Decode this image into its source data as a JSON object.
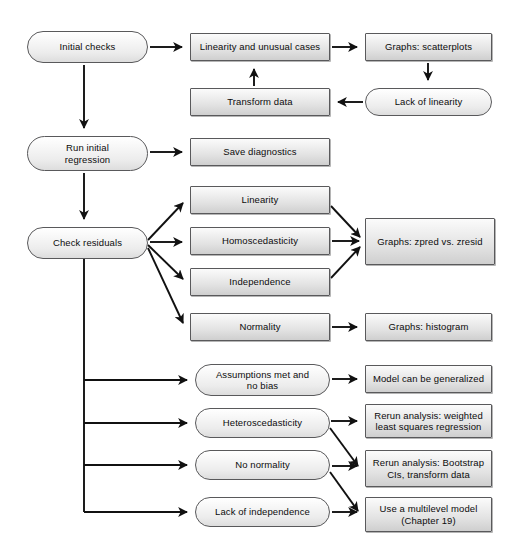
{
  "diagram": {
    "style": {
      "node_fill_top": "#fbfbfb",
      "node_fill_bottom": "#cfcfcf",
      "node_border": "#59595b",
      "edge_color": "#1a1a1a",
      "text_color": "#0c0c0c",
      "background": "#ffffff"
    },
    "nodes": [
      {
        "id": "initial_checks",
        "label": "Initial checks",
        "shape": "pill",
        "x": 27,
        "y": 31,
        "w": 121,
        "h": 32
      },
      {
        "id": "linearity_unusual",
        "label": "Linearity and unusual cases",
        "shape": "rect",
        "x": 190,
        "y": 33,
        "w": 140,
        "h": 28
      },
      {
        "id": "graphs_scatterplots",
        "label": "Graphs: scatterplots",
        "shape": "rect",
        "x": 365,
        "y": 33,
        "w": 127,
        "h": 28
      },
      {
        "id": "transform_data",
        "label": "Transform data",
        "shape": "rect",
        "x": 190,
        "y": 88,
        "w": 140,
        "h": 28
      },
      {
        "id": "lack_of_linearity",
        "label": "Lack of linearity",
        "shape": "pill",
        "x": 365,
        "y": 88,
        "w": 127,
        "h": 28
      },
      {
        "id": "run_initial_regression",
        "label": "Run initial\nregression",
        "shape": "pill",
        "x": 27,
        "y": 136,
        "w": 121,
        "h": 35
      },
      {
        "id": "save_diagnostics",
        "label": "Save diagnostics",
        "shape": "rect",
        "x": 190,
        "y": 138,
        "w": 140,
        "h": 28
      },
      {
        "id": "check_residuals",
        "label": "Check residuals",
        "shape": "pill",
        "x": 27,
        "y": 227,
        "w": 121,
        "h": 32
      },
      {
        "id": "linearity",
        "label": "Linearity",
        "shape": "rect",
        "x": 190,
        "y": 186,
        "w": 140,
        "h": 28
      },
      {
        "id": "homoscedasticity",
        "label": "Homoscedasticity",
        "shape": "rect",
        "x": 190,
        "y": 227,
        "w": 140,
        "h": 28
      },
      {
        "id": "independence",
        "label": "Independence",
        "shape": "rect",
        "x": 190,
        "y": 268,
        "w": 140,
        "h": 28
      },
      {
        "id": "graphs_zpred_zresid",
        "label": "Graphs: zpred vs. zresid",
        "shape": "rect",
        "x": 365,
        "y": 218,
        "w": 130,
        "h": 47
      },
      {
        "id": "normality",
        "label": "Normality",
        "shape": "rect",
        "x": 190,
        "y": 313,
        "w": 140,
        "h": 28
      },
      {
        "id": "graphs_histogram",
        "label": "Graphs: histogram",
        "shape": "rect",
        "x": 365,
        "y": 313,
        "w": 127,
        "h": 28
      },
      {
        "id": "assumptions_met",
        "label": "Assumptions met and\nno bias",
        "shape": "pill",
        "x": 195,
        "y": 364,
        "w": 135,
        "h": 32
      },
      {
        "id": "model_generalized",
        "label": "Model can be generalized",
        "shape": "rect",
        "x": 365,
        "y": 365,
        "w": 127,
        "h": 28
      },
      {
        "id": "heteroscedasticity",
        "label": "Heteroscedasticity",
        "shape": "pill",
        "x": 195,
        "y": 408,
        "w": 135,
        "h": 30
      },
      {
        "id": "rerun_wls",
        "label": "Rerun analysis: weighted\nleast squares regression",
        "shape": "rect",
        "x": 365,
        "y": 404,
        "w": 127,
        "h": 34
      },
      {
        "id": "no_normality",
        "label": "No normality",
        "shape": "pill",
        "x": 195,
        "y": 450,
        "w": 135,
        "h": 30
      },
      {
        "id": "rerun_bootstrap",
        "label": "Rerun analysis: Bootstrap\nCIs, transform data",
        "shape": "rect",
        "x": 365,
        "y": 450,
        "w": 127,
        "h": 37
      },
      {
        "id": "lack_of_independence",
        "label": "Lack of independence",
        "shape": "pill",
        "x": 195,
        "y": 497,
        "w": 135,
        "h": 30
      },
      {
        "id": "multilevel_model",
        "label": "Use a multilevel model\n(Chapter 19)",
        "shape": "rect",
        "x": 365,
        "y": 497,
        "w": 127,
        "h": 35
      }
    ],
    "edges": [
      {
        "from": "initial_checks",
        "to": "linearity_unusual",
        "path": "M 150,47 L 182,47"
      },
      {
        "from": "linearity_unusual",
        "to": "graphs_scatterplots",
        "path": "M 332,47 L 357,47"
      },
      {
        "from": "graphs_scatterplots",
        "to": "lack_of_linearity",
        "path": "M 428,63 L 428,80"
      },
      {
        "from": "lack_of_linearity",
        "to": "transform_data",
        "path": "M 363,102 L 338,102"
      },
      {
        "from": "transform_data",
        "to": "linearity_unusual",
        "path": "M 254,86 L 254,69"
      },
      {
        "from": "initial_checks",
        "to": "run_initial_regression",
        "path": "M 84,65 L 84,128"
      },
      {
        "from": "run_initial_regression",
        "to": "save_diagnostics",
        "path": "M 150,152 L 182,152"
      },
      {
        "from": "run_initial_regression",
        "to": "check_residuals",
        "path": "M 84,173 L 84,219"
      },
      {
        "from": "check_residuals",
        "to": "linearity",
        "path": "M 148,240 L 183,203"
      },
      {
        "from": "check_residuals",
        "to": "homoscedasticity",
        "path": "M 150,242 L 182,242"
      },
      {
        "from": "check_residuals",
        "to": "independence",
        "path": "M 148,245 L 183,279"
      },
      {
        "from": "check_residuals",
        "to": "normality",
        "path": "M 148,248 L 183,323"
      },
      {
        "from": "linearity",
        "to": "graphs_zpred_zresid",
        "path": "M 331,206 L 360,237"
      },
      {
        "from": "homoscedasticity",
        "to": "graphs_zpred_zresid",
        "path": "M 332,241 L 359,241"
      },
      {
        "from": "independence",
        "to": "graphs_zpred_zresid",
        "path": "M 331,278 L 360,247"
      },
      {
        "from": "normality",
        "to": "graphs_histogram",
        "path": "M 332,327 L 357,327"
      },
      {
        "from": "check_residuals",
        "to": "assumptions_met",
        "path": "M 84,380 L 187,380"
      },
      {
        "from": "check_residuals",
        "to": "heteroscedasticity",
        "path": "M 84,423 L 187,423"
      },
      {
        "from": "check_residuals",
        "to": "no_normality",
        "path": "M 84,465 L 187,465"
      },
      {
        "from": "check_residuals",
        "to": "lack_of_independence",
        "path": "M 84,512 L 187,512"
      },
      {
        "from": "assumptions_met",
        "to": "model_generalized",
        "path": "M 332,379 L 357,379"
      },
      {
        "from": "heteroscedasticity",
        "to": "rerun_wls",
        "path": "M 331,421 L 357,421"
      },
      {
        "from": "heteroscedasticity",
        "to": "rerun_bootstrap",
        "path": "M 330,428 L 358,466"
      },
      {
        "from": "no_normality",
        "to": "rerun_bootstrap",
        "path": "M 332,466 L 357,466"
      },
      {
        "from": "no_normality",
        "to": "multilevel_model",
        "path": "M 330,472 L 358,511"
      },
      {
        "from": "lack_of_independence",
        "to": "multilevel_model",
        "path": "M 332,512 L 357,512"
      }
    ],
    "spine": {
      "path": "M 84,259 L 84,512",
      "x": 84,
      "y_top": 259,
      "y_bottom": 512
    }
  }
}
